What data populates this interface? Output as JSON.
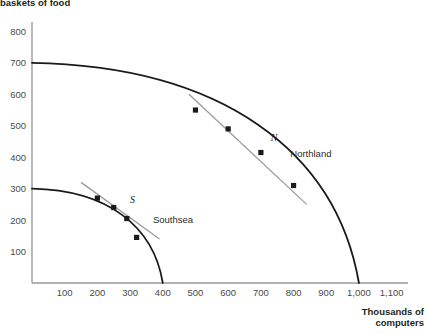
{
  "chart_data": {
    "type": "line",
    "title": "",
    "xlabel": "Thousands of computers",
    "ylabel": "Thousands of baskets of food",
    "ylabel_visible": "baskets of food",
    "xlim": [
      0,
      1150
    ],
    "ylim": [
      0,
      830
    ],
    "xticks": [
      100,
      200,
      300,
      400,
      500,
      600,
      700,
      800,
      900,
      1000,
      1100
    ],
    "xticklabels": [
      "100",
      "200",
      "300",
      "400",
      "500",
      "600",
      "700",
      "800",
      "900",
      "1,000",
      "1,100"
    ],
    "yticks": [
      100,
      200,
      300,
      400,
      500,
      600,
      700,
      800
    ],
    "yticklabels": [
      "100",
      "200",
      "300",
      "400",
      "500",
      "600",
      "700",
      "800"
    ],
    "grid": false,
    "legend": "none",
    "series": [
      {
        "name": "Northland",
        "label": "Northland",
        "point_label": "N",
        "color": "#1a1a1a",
        "intercept_y": 700,
        "intercept_x": 1000,
        "points": [
          {
            "x": 500,
            "y": 550
          },
          {
            "x": 600,
            "y": 490
          },
          {
            "x": 700,
            "y": 415
          },
          {
            "x": 800,
            "y": 310
          }
        ],
        "tangent": {
          "color": "#9a9a9a",
          "x1": 480,
          "y1": 600,
          "x2": 840,
          "y2": 250
        }
      },
      {
        "name": "Southsea",
        "label": "Southsea",
        "point_label": "S",
        "color": "#1a1a1a",
        "intercept_y": 300,
        "intercept_x": 400,
        "points": [
          {
            "x": 200,
            "y": 270
          },
          {
            "x": 250,
            "y": 240
          },
          {
            "x": 290,
            "y": 205
          },
          {
            "x": 320,
            "y": 145
          }
        ],
        "tangent": {
          "color": "#9a9a9a",
          "x1": 150,
          "y1": 320,
          "x2": 390,
          "y2": 140
        }
      }
    ],
    "annotations": [
      {
        "text": "N",
        "x": 730,
        "y": 450,
        "style": "italic"
      },
      {
        "text": "Northland",
        "x": 790,
        "y": 400,
        "style": "normal"
      },
      {
        "text": "S",
        "x": 300,
        "y": 255,
        "style": "italic"
      },
      {
        "text": "Southsea",
        "x": 370,
        "y": 190,
        "style": "normal"
      }
    ]
  },
  "axis": {
    "color": "#9a9a9a",
    "x_title": "Thousands of computers",
    "y_title": "baskets of food"
  }
}
